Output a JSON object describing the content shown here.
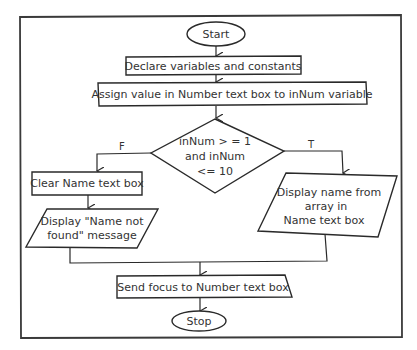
{
  "flowchart": {
    "start": {
      "label": "Start",
      "shape": "terminal"
    },
    "step_declare": {
      "label": "Declare variables and constants",
      "shape": "process"
    },
    "step_assign": {
      "label": "Assign value in Number text box to inNum variable",
      "shape": "process"
    },
    "decision": {
      "shape": "decision",
      "lines": [
        "inNum > = 1",
        "and inNum",
        "<= 10"
      ],
      "false_label": "F",
      "true_label": "T"
    },
    "false_branch": {
      "clear": {
        "label": "Clear Name text box",
        "shape": "process"
      },
      "display": {
        "lines": [
          "Display \"Name not",
          "found\" message"
        ],
        "shape": "input-output"
      }
    },
    "true_branch": {
      "display": {
        "lines": [
          "Display name from",
          "array in",
          "Name text box"
        ],
        "shape": "input-output"
      }
    },
    "step_focus": {
      "label": "Send focus to Number text box",
      "shape": "process"
    },
    "stop": {
      "label": "Stop",
      "shape": "terminal"
    }
  },
  "colors": {
    "stroke": "#2a2a2a",
    "text": "#333333",
    "background": "#ffffff"
  }
}
